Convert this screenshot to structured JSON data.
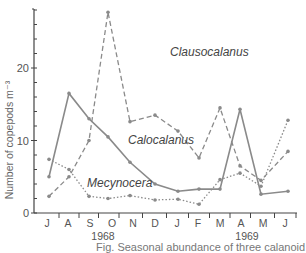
{
  "chart_data": {
    "type": "line",
    "title": "",
    "xlabel": "",
    "ylabel": "Number of copepods m⁻³",
    "ylim": [
      0,
      28
    ],
    "yticks": [
      0,
      10,
      20
    ],
    "y_minor_step": 2,
    "grid": false,
    "categories": [
      "J",
      "A",
      "S",
      "O",
      "N",
      "D",
      "J",
      "F",
      "M",
      "A",
      "M",
      "J"
    ],
    "year_labels": [
      {
        "label": "1968",
        "at_index": 3
      },
      {
        "label": "1969",
        "at_index": 8.5
      }
    ],
    "series": [
      {
        "name": "Calocalanus",
        "style": "solid",
        "values": [
          5,
          16.5,
          13,
          10.5,
          7,
          4,
          3,
          3.3,
          3.3,
          14.3,
          2.6,
          3
        ]
      },
      {
        "name": "Clausocalanus",
        "style": "dashed",
        "values": [
          2.3,
          5,
          10,
          27.7,
          12.6,
          13.5,
          11.3,
          7.6,
          14.5,
          6.5,
          4.5,
          8.5
        ]
      },
      {
        "name": "Mecynocera",
        "style": "dotted",
        "values": [
          7.4,
          6,
          2.3,
          2,
          2.4,
          1.8,
          1.9,
          1.2,
          4.6,
          5.5,
          3.7,
          12.8
        ]
      }
    ],
    "annotations": [
      {
        "text": "Clausocalanus",
        "x_index": 5.5,
        "y": 19
      },
      {
        "text": "Calocalanus",
        "x_index": 4.3,
        "y": 9.5
      },
      {
        "text": "Mecynocera",
        "x_index": 2.2,
        "y": 4
      }
    ],
    "legend_position": "inline-labels"
  },
  "caption": "Fig. Seasonal abundance of three calanoid"
}
